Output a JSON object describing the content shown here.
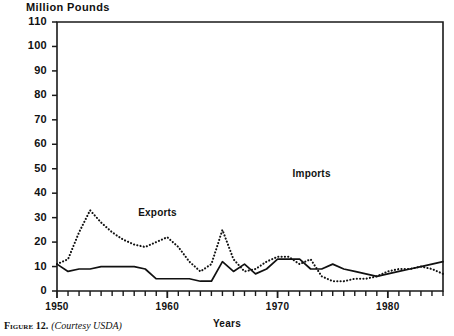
{
  "figure": {
    "caption_prefix": "Figure",
    "caption_number": "12.",
    "caption_source": "(Courtesy USDA)"
  },
  "chart_data": {
    "type": "line",
    "title": "",
    "ylabel": "Million Pounds",
    "xlabel": "Years",
    "xlim": [
      1950,
      1985
    ],
    "ylim": [
      0,
      110
    ],
    "ytick_values": [
      0,
      10,
      20,
      30,
      40,
      50,
      60,
      70,
      80,
      90,
      100,
      110
    ],
    "ytick_labels": [
      "0",
      "10",
      "20",
      "30",
      "40",
      "50",
      "60",
      "70",
      "80",
      "90",
      "100",
      "110"
    ],
    "xtick_values": [
      1950,
      1960,
      1970,
      1980
    ],
    "xtick_labels": [
      "1950",
      "1960",
      "1970",
      "1980"
    ],
    "xtick_minor_step": 1,
    "grid": false,
    "legend": "inline-annotations",
    "x": [
      1950,
      1951,
      1952,
      1953,
      1954,
      1955,
      1956,
      1957,
      1958,
      1959,
      1960,
      1961,
      1962,
      1963,
      1964,
      1965,
      1966,
      1967,
      1968,
      1969,
      1970,
      1971,
      1972,
      1973,
      1974,
      1975,
      1976,
      1977,
      1978,
      1979,
      1980,
      1981,
      1982,
      1983,
      1984,
      1985
    ],
    "series": [
      {
        "name": "Exports",
        "style": "dotted",
        "color": "#111111",
        "label_x": 1957,
        "label_y": 31,
        "values": [
          11,
          13,
          24,
          33,
          28,
          24,
          21,
          19,
          18,
          20,
          22,
          18,
          12,
          8,
          11,
          25,
          13,
          8,
          9,
          12,
          14,
          14,
          11,
          13,
          6,
          4,
          4,
          5,
          5,
          6,
          8,
          9,
          9,
          10,
          9,
          7
        ]
      },
      {
        "name": "Imports",
        "style": "solid",
        "color": "#111111",
        "label_x": 1971,
        "label_y": 47,
        "values": [
          11,
          8,
          9,
          9,
          10,
          10,
          10,
          10,
          9,
          5,
          5,
          5,
          5,
          4,
          4,
          12,
          8,
          11,
          7,
          9,
          13,
          13,
          13,
          9,
          9,
          11,
          9,
          8,
          7,
          6,
          7,
          8,
          9,
          10,
          11,
          12
        ]
      }
    ],
    "annotations": [
      {
        "text": "Exports",
        "x": 1957,
        "y": 31
      },
      {
        "text": "Imports",
        "x": 1971,
        "y": 47
      }
    ]
  }
}
